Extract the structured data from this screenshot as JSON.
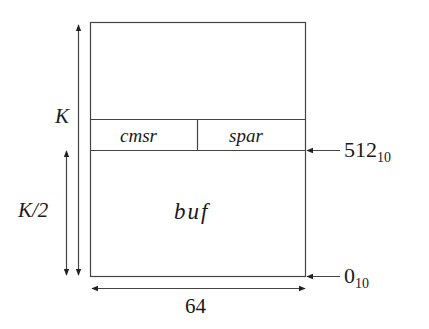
{
  "diagram": {
    "regions": [
      {
        "name": "cmsr",
        "label": "cmsr"
      },
      {
        "name": "spar",
        "label": "spar"
      },
      {
        "name": "buf",
        "label": "buf"
      }
    ],
    "dimensions": {
      "total_height_label": "K",
      "half_height_label": "K/2",
      "width_label": "64"
    },
    "address_markers": [
      {
        "value": "512",
        "base": "10"
      },
      {
        "value": "0",
        "base": "10"
      }
    ],
    "colors": {
      "line": "#333333",
      "background": "#ffffff"
    }
  }
}
